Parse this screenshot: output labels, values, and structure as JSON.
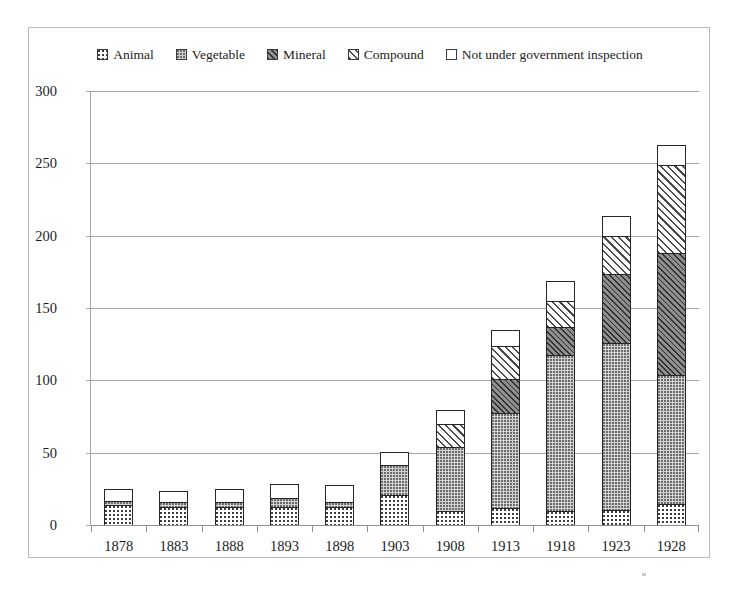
{
  "chart_data": {
    "type": "bar",
    "subtype": "stacked-bar",
    "title": "",
    "xlabel": "",
    "ylabel": "",
    "ylim": [
      0,
      300
    ],
    "ytick_values": [
      300,
      250,
      200,
      150,
      100,
      50,
      0
    ],
    "ytick_labels": [
      "300",
      "250",
      "200",
      "150",
      "100",
      "50",
      "0"
    ],
    "grid": true,
    "grid_axis": "y",
    "legend_position": "top-center",
    "categories": [
      "1878",
      "1883",
      "1888",
      "1893",
      "1898",
      "1903",
      "1908",
      "1913",
      "1918",
      "1923",
      "1928"
    ],
    "series": [
      {
        "name": "Animal",
        "pattern": "fine-dots-on-white",
        "color": "#ffffff",
        "values": [
          13,
          12,
          12,
          12,
          12,
          20,
          9,
          11,
          9,
          10,
          14
        ]
      },
      {
        "name": "Vegetable",
        "pattern": "dense-dots-on-gray",
        "color": "#d2d2d2",
        "values": [
          3,
          3,
          3,
          6,
          3,
          21,
          44,
          66,
          108,
          115,
          89
        ]
      },
      {
        "name": "Mineral",
        "pattern": "dark-diagonal-hatch",
        "color": "#8e8e8e",
        "values": [
          0,
          0,
          0,
          0,
          0,
          0,
          0,
          23,
          19,
          48,
          84
        ]
      },
      {
        "name": "Compound",
        "pattern": "diagonal-hatch-on-white",
        "color": "#ffffff",
        "values": [
          0,
          0,
          0,
          0,
          0,
          0,
          16,
          23,
          18,
          26,
          61
        ]
      },
      {
        "name": "Not under government inspection",
        "pattern": "solid-white",
        "color": "#ffffff",
        "values": [
          8,
          8,
          9,
          10,
          12,
          9,
          10,
          11,
          14,
          14,
          14
        ]
      }
    ],
    "totals": [
      24,
      23,
      24,
      28,
      27,
      50,
      79,
      134,
      168,
      213,
      262
    ]
  },
  "legend": {
    "items": [
      {
        "label": "Animal",
        "swatch": "swatch-animal"
      },
      {
        "label": "Vegetable",
        "swatch": "swatch-vegetable"
      },
      {
        "label": "Mineral",
        "swatch": "swatch-mineral"
      },
      {
        "label": "Compound",
        "swatch": "swatch-compound"
      },
      {
        "label": "Not under government inspection",
        "swatch": "swatch-not-inspected"
      }
    ]
  }
}
